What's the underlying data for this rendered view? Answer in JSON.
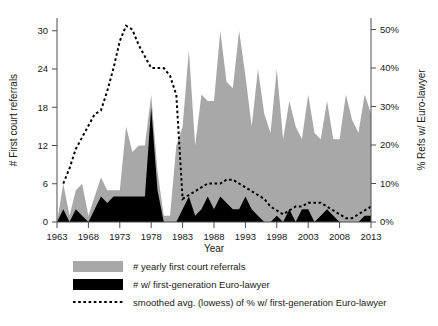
{
  "chart_data": {
    "type": "area",
    "title": "",
    "subtitle": "",
    "xlabel": "Year",
    "ylabel": "# First court referrals",
    "y2label": "% Refs w/ Euro-lawyer",
    "xlim": [
      1963,
      2013
    ],
    "ylim": [
      0,
      32
    ],
    "y2lim": [
      0,
      53
    ],
    "grid": false,
    "legend_position": "below",
    "xticks": [
      1963,
      1968,
      1973,
      1978,
      1983,
      1988,
      1993,
      1998,
      2003,
      2008,
      2013
    ],
    "xticklabels": [
      "1963",
      "1968",
      "1973",
      "1978",
      "1983",
      "1988",
      "1993",
      "1998",
      "2003",
      "2008",
      "2013"
    ],
    "yticks": [
      0,
      6,
      12,
      18,
      24,
      30
    ],
    "yticklabels": [
      "0",
      "6",
      "12",
      "18",
      "24",
      "30"
    ],
    "y2ticks": [
      0,
      10,
      20,
      30,
      40,
      50
    ],
    "y2ticklabels": [
      "0%",
      "10%",
      "20%",
      "30%",
      "40%",
      "50%"
    ],
    "colors": {
      "total_area": "#a8a8a8",
      "eurolawyer_area": "#000000",
      "smoothed_line": "#000000",
      "axis": "#4d4d4d",
      "background": "#ffffff"
    },
    "x": [
      1963,
      1964,
      1965,
      1966,
      1967,
      1968,
      1969,
      1970,
      1971,
      1972,
      1973,
      1974,
      1975,
      1976,
      1977,
      1978,
      1979,
      1980,
      1981,
      1982,
      1983,
      1984,
      1985,
      1986,
      1987,
      1988,
      1989,
      1990,
      1991,
      1992,
      1993,
      1994,
      1995,
      1996,
      1997,
      1998,
      1999,
      2000,
      2001,
      2002,
      2003,
      2004,
      2005,
      2006,
      2007,
      2008,
      2009,
      2010,
      2011,
      2012,
      2013
    ],
    "series": [
      {
        "name": "# yearly first court referrals",
        "axis": "left",
        "type": "area",
        "color": "#a8a8a8",
        "values": [
          0,
          6,
          1,
          5,
          6,
          1,
          4,
          7,
          5,
          5,
          5,
          15,
          11,
          12,
          12,
          20,
          8,
          1,
          1,
          12,
          15,
          27,
          12,
          20,
          19,
          19,
          30,
          22,
          21,
          30,
          23,
          15,
          24,
          17,
          14,
          24,
          13,
          19,
          15,
          13,
          20,
          14,
          13,
          19,
          13,
          13,
          20,
          16,
          14,
          20,
          17
        ]
      },
      {
        "name": "# w/ first-generation Euro-lawyer",
        "axis": "left",
        "type": "area",
        "color": "#000000",
        "values": [
          0,
          2,
          0,
          2,
          1,
          0,
          2,
          4,
          3,
          4,
          4,
          4,
          4,
          4,
          4,
          18,
          5,
          0,
          0,
          0,
          2,
          4,
          1,
          2,
          4,
          2,
          4,
          3,
          2,
          2,
          4,
          2,
          1,
          0,
          0,
          1,
          0,
          2,
          0,
          2,
          2,
          0,
          1,
          2,
          1,
          0,
          0,
          0,
          0,
          1,
          1
        ]
      },
      {
        "name": "smoothed avg. (lowess) of % w/ first-generation Euro-lawyer",
        "axis": "right",
        "type": "line",
        "style": "dotted",
        "color": "#000000",
        "values": [
          null,
          10,
          14,
          19,
          22,
          25,
          28,
          29,
          34,
          40,
          47,
          51,
          50,
          46,
          43,
          40,
          40,
          40,
          38,
          33,
          6,
          7,
          8,
          9,
          10,
          10,
          10,
          11,
          11,
          10,
          9,
          8,
          7,
          6,
          4,
          3,
          2,
          3,
          4,
          4,
          5,
          5,
          5,
          4,
          3,
          2,
          1,
          1,
          2,
          3,
          4
        ]
      }
    ],
    "annotations": []
  },
  "legend": {
    "items": [
      {
        "key": "swatch-grey",
        "label": "# yearly first court referrals"
      },
      {
        "key": "swatch-black",
        "label": "# w/ first-generation Euro-lawyer"
      },
      {
        "key": "swatch-dotted",
        "label": "smoothed avg. (lowess) of % w/ first-generation Euro-lawyer"
      }
    ]
  }
}
